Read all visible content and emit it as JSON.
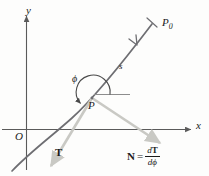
{
  "figure": {
    "background_color": "#fdfdfc",
    "axis_color": "#5a5a5a",
    "curve_color": "#6e6e72",
    "vector_color": "#c9c9c4",
    "text_color": "#1b1b1b",
    "width": 209,
    "height": 176
  },
  "axes": {
    "x_label": "x",
    "y_label": "y",
    "origin_label": "O"
  },
  "curve": {
    "arc_length_label": "s",
    "start_point_label": "P",
    "end_point_label": "P",
    "end_point_subscript": "0",
    "direction_arrow": "arrow-toward-P"
  },
  "angle": {
    "symbol": "ϕ",
    "description": "angle from positive horizontal reference to tangent direction"
  },
  "vectors": {
    "tangent": {
      "label": "T",
      "direction": "down-left from P"
    },
    "normal": {
      "label": "N",
      "direction": "down-right from P"
    }
  },
  "equation": {
    "lhs": "N",
    "relation": "=",
    "numerator_d": "d",
    "numerator_T": "T",
    "denominator_d": "d",
    "denominator_phi": "ϕ"
  }
}
